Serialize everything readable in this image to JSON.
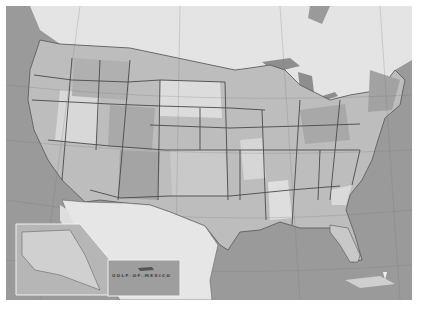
{
  "map": {
    "title": "United States",
    "style": "grayscale-political",
    "labels": {
      "gulf": "GULF OF MEXICO",
      "canada": "CANADA",
      "mexico": "MEXICO",
      "alaska": "ALASKA",
      "hawaii": "HAWAII"
    },
    "insets": [
      {
        "name": "alaska-inset"
      },
      {
        "name": "hawaii-inset"
      }
    ],
    "colors": {
      "ocean": "#9a9a9a",
      "land_light": "#e2e2e2",
      "land_mid": "#bdbdbd",
      "land_dark": "#a6a6a6",
      "border": "#444444",
      "background": "#ffffff"
    }
  }
}
